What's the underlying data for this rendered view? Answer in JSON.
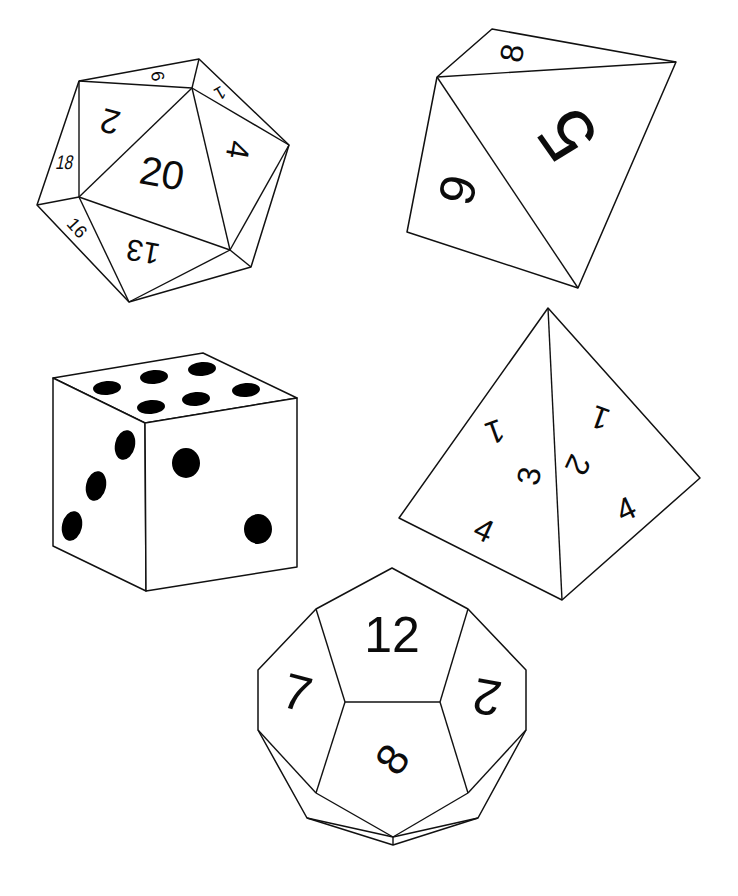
{
  "colors": {
    "ink": "#111111",
    "paper": "#ffffff"
  },
  "dice": {
    "d20": {
      "name": "Icosahedron (d20)",
      "faces": [
        "20",
        "2",
        "9",
        "1",
        "4",
        "18",
        "16",
        "13"
      ]
    },
    "d8": {
      "name": "Octahedron (d8)",
      "faces": [
        "5",
        "8",
        "9"
      ]
    },
    "d6": {
      "name": "Cube (d6)",
      "top_pips": 6,
      "left_pips": 3,
      "right_pips": 2
    },
    "d4": {
      "name": "Tetrahedron (d4)",
      "left_face": [
        "1",
        "3",
        "4"
      ],
      "right_face": [
        "1",
        "2",
        "4"
      ]
    },
    "d12": {
      "name": "Dodecahedron (d12)",
      "faces": [
        "12",
        "7",
        "2",
        "8"
      ]
    }
  }
}
